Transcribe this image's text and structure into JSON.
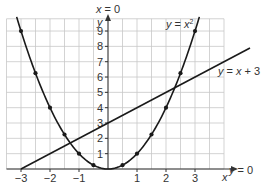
{
  "chart_data": {
    "type": "line",
    "title": "",
    "xlabel": "x",
    "ylabel": "y",
    "xlim": [
      -3.5,
      4
    ],
    "ylim": [
      0,
      10
    ],
    "grid": true,
    "x_ticks": [
      -3,
      -2,
      -1,
      1,
      2,
      3
    ],
    "y_ticks": [
      1,
      2,
      3,
      4,
      5,
      6,
      7,
      8,
      9
    ],
    "axis_labels": {
      "x_axis_line": "y = 0",
      "y_axis_line": "x = 0"
    },
    "series": [
      {
        "name": "y = x²",
        "type": "curve",
        "x": [
          -3,
          -2.5,
          -2,
          -1.5,
          -1,
          -0.5,
          0,
          0.5,
          1,
          1.5,
          2,
          2.5,
          3
        ],
        "y": [
          9,
          6.25,
          4,
          2.25,
          1,
          0.25,
          0,
          0.25,
          1,
          2.25,
          4,
          6.25,
          9
        ],
        "markers": [
          [
            -3,
            9
          ],
          [
            -2.5,
            6.25
          ],
          [
            -2,
            4
          ],
          [
            -1.5,
            2.25
          ],
          [
            -1,
            1
          ],
          [
            -0.5,
            0.25
          ],
          [
            0.5,
            0.25
          ],
          [
            1,
            1
          ],
          [
            1.5,
            2.25
          ],
          [
            2,
            4
          ],
          [
            2.5,
            6.25
          ],
          [
            3,
            9
          ]
        ]
      },
      {
        "name": "y = x + 3",
        "type": "line",
        "x": [
          -3,
          4
        ],
        "y": [
          0,
          7
        ]
      }
    ]
  },
  "labels": {
    "x_axis_eq": "y = 0",
    "y_axis_eq": "x = 0",
    "x_axis_var": "x",
    "y_axis_var": "y",
    "parabola_label_prefix": "y = x",
    "parabola_label_sup": "2",
    "line_label": "y = x + 3"
  },
  "tick_labels": {
    "x": [
      "−3",
      "−2",
      "−1",
      "1",
      "2",
      "3"
    ],
    "y": [
      "1",
      "2",
      "3",
      "4",
      "5",
      "6",
      "7",
      "8",
      "9"
    ]
  }
}
